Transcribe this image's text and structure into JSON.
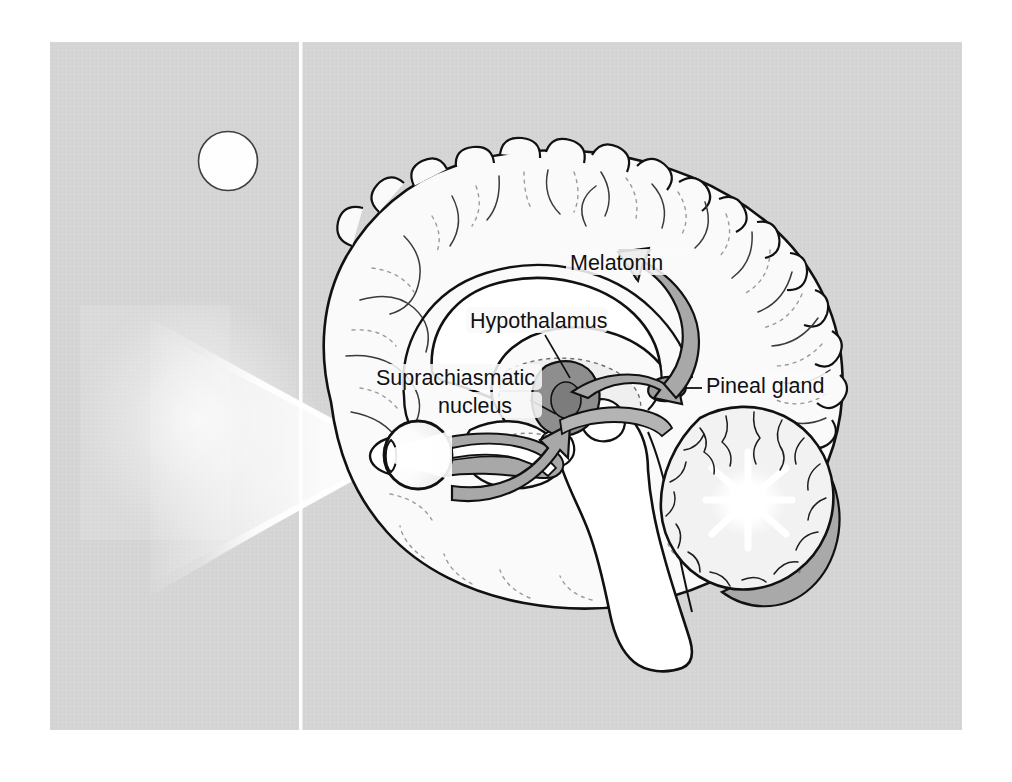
{
  "figure": {
    "kind": "anatomical-diagram",
    "background_color": "#d5d5d5",
    "page_color": "#ffffff",
    "ink_color": "#111111",
    "panel": {
      "x": 50,
      "y": 42,
      "width": 912,
      "height": 688
    },
    "divider_line_x": 301
  },
  "labels": {
    "melatonin": "Melatonin",
    "hypothalamus": "Hypothalamus",
    "suprachiasmatic_line1": "Suprachiasmatic",
    "suprachiasmatic_line2": "nucleus",
    "pineal": "Pineal gland"
  },
  "elements": {
    "sun": {
      "name": "sun",
      "cx": 228,
      "cy": 161,
      "r": 29,
      "fill": "#fefefe",
      "stroke": "#3a3a3a"
    },
    "light_beam": {
      "name": "light-beam",
      "fill": "#ffffff"
    },
    "eye": {
      "name": "eye",
      "cx": 418,
      "cy": 455,
      "r": 34
    },
    "brain": {
      "name": "brain-sagittal-section",
      "fill": "#fbfbfb",
      "stroke": "#111111"
    },
    "cerebellum": {
      "name": "cerebellum",
      "fill": "#f4f4f4"
    },
    "brainstem": {
      "name": "brainstem",
      "fill": "#ffffff"
    },
    "scn": {
      "name": "suprachiasmatic-nucleus",
      "fill": "#8e8e8e"
    },
    "pineal_gland": {
      "name": "pineal-gland",
      "fill": "#9d9d9d"
    },
    "optic_pathway_arrow": {
      "name": "optic-pathway-arrow",
      "fill": "#a8a8a8"
    },
    "melatonin_arrow": {
      "name": "melatonin-arrow",
      "fill": "#a8a8a8"
    },
    "corpus_callosum": {
      "name": "corpus-callosum",
      "fill": "#ffffff"
    }
  },
  "flow": {
    "type": "pathway",
    "steps": [
      {
        "from": "sun",
        "to": "eye",
        "channel": "light"
      },
      {
        "from": "eye",
        "to": "suprachiasmatic-nucleus",
        "channel": "retinohypothalamic tract"
      },
      {
        "from": "suprachiasmatic-nucleus",
        "to": "pineal-gland",
        "channel": "neural signal"
      },
      {
        "from": "pineal-gland",
        "to": "brain",
        "channel": "melatonin"
      }
    ]
  }
}
